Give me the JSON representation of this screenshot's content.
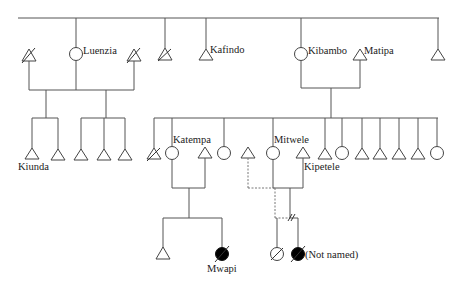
{
  "diagram": {
    "type": "kinship-genealogy",
    "legend_symbols": {
      "male": "triangle",
      "female": "circle",
      "deceased": "diagonal-slash",
      "filled": "black-filled-circle",
      "dashed_line": "non-marital-relation",
      "double_slash": "break-in-relationship"
    },
    "colors": {
      "line": "#555555",
      "symbol_stroke": "#444444",
      "filled": "#000000",
      "background": "#ffffff"
    },
    "labels": {
      "luenzia": "Luenzia",
      "kafindo": "Kafindo",
      "kibambo": "Kibambo",
      "matipa": "Matipa",
      "kiunda": "Kiunda",
      "katempa": "Katempa",
      "mitwele": "Mitwele",
      "kipetele": "Kipetele",
      "mwapi": "Mwapi",
      "not_named": "(Not named)"
    },
    "generations": [
      {
        "level": 1,
        "members": [
          {
            "sex": "male",
            "deceased": true,
            "name": ""
          },
          {
            "sex": "female",
            "deceased": false,
            "name": "Luenzia"
          },
          {
            "sex": "male",
            "deceased": true,
            "name": ""
          },
          {
            "sex": "male",
            "deceased": true,
            "name": ""
          },
          {
            "sex": "male",
            "deceased": false,
            "name": "Kafindo"
          },
          {
            "sex": "female",
            "deceased": false,
            "name": "Kibambo"
          },
          {
            "sex": "male",
            "deceased": false,
            "name": "Matipa"
          },
          {
            "sex": "male",
            "deceased": false,
            "name": ""
          }
        ]
      },
      {
        "level": 2,
        "members": [
          {
            "sex": "male",
            "name": "Kiunda"
          },
          {
            "sex": "male",
            "name": ""
          },
          {
            "sex": "male",
            "name": ""
          },
          {
            "sex": "male",
            "name": ""
          },
          {
            "sex": "male",
            "name": ""
          },
          {
            "sex": "male",
            "deceased": true,
            "name": ""
          },
          {
            "sex": "female",
            "name": "Katempa"
          },
          {
            "sex": "male",
            "name": "",
            "role": "spouse of Katempa"
          },
          {
            "sex": "female",
            "name": ""
          },
          {
            "sex": "male",
            "name": "",
            "role": "dashed partner of Mitwele"
          },
          {
            "sex": "female",
            "name": "Mitwele"
          },
          {
            "sex": "male",
            "name": "Kipetele",
            "role": "spouse of Mitwele"
          },
          {
            "sex": "male",
            "name": ""
          },
          {
            "sex": "female",
            "name": ""
          },
          {
            "sex": "male",
            "name": ""
          },
          {
            "sex": "male",
            "name": ""
          },
          {
            "sex": "male",
            "name": ""
          },
          {
            "sex": "male",
            "name": ""
          },
          {
            "sex": "female",
            "name": ""
          }
        ]
      },
      {
        "level": 3,
        "members": [
          {
            "sex": "male",
            "name": ""
          },
          {
            "sex": "female",
            "filled": true,
            "deceased": true,
            "name": "Mwapi"
          },
          {
            "sex": "female",
            "deceased": true,
            "name": ""
          },
          {
            "sex": "female",
            "filled": true,
            "deceased": true,
            "name": "(Not named)"
          }
        ]
      }
    ]
  }
}
